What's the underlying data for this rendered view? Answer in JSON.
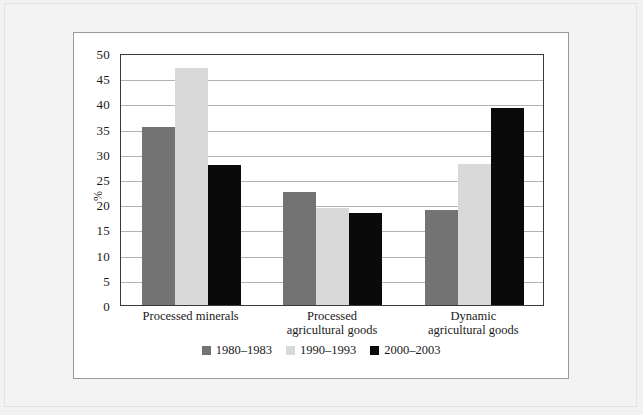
{
  "chart_data": {
    "type": "bar",
    "title": "",
    "xlabel": "",
    "ylabel": "%",
    "ylim": [
      0,
      50
    ],
    "yticks": [
      0,
      5,
      10,
      15,
      20,
      25,
      30,
      35,
      40,
      45,
      50
    ],
    "ytick_labels": [
      "0",
      "5",
      "10",
      "15",
      "20",
      "25",
      "30",
      "35",
      "40",
      "45",
      "50"
    ],
    "grid": true,
    "legend_position": "bottom",
    "categories": [
      "Processed minerals",
      "Processed agricultural goods",
      "Dynamic agricultural goods"
    ],
    "category_lines": [
      [
        "Processed minerals"
      ],
      [
        "Processed",
        "agricultural goods"
      ],
      [
        "Dynamic",
        "agricultural goods"
      ]
    ],
    "series": [
      {
        "name": "1980–1983",
        "color": "#737373",
        "values": [
          35.4,
          22.5,
          18.9
        ]
      },
      {
        "name": "1990–1993",
        "color": "#d9d9d9",
        "values": [
          47.0,
          19.2,
          28.0
        ]
      },
      {
        "name": "2000–2003",
        "color": "#0a0a0a",
        "values": [
          27.7,
          18.2,
          39.0
        ]
      }
    ]
  },
  "legend": {
    "items": [
      {
        "label": "1980–1983"
      },
      {
        "label": "1990–1993"
      },
      {
        "label": "2000–2003"
      }
    ]
  }
}
